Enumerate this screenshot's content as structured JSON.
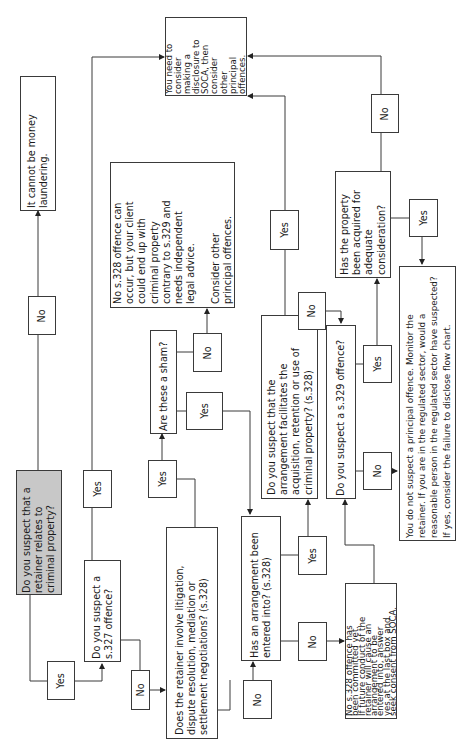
{
  "flowchart": {
    "orientation": "rotated-90-ccw",
    "nodes": {
      "start": {
        "text": "Do you suspect that a\nretainer relates to\ncriminal property?"
      },
      "not_ml": {
        "text": "It cannot be money\nlaundering."
      },
      "s327": {
        "text": "Do you suspect a\ns.327 offence?"
      },
      "disclose": {
        "text": "You need to\nconsider\nmaking a\ndisclosure to\nSOCA, then\nconsider\nother\nprincipal\noffences."
      },
      "litigation": {
        "text": "Does the retainer involve litigation,\ndispute resolution, mediation or\nsettlement negotiations? (s.328)"
      },
      "sham": {
        "text": "Are these a sham?"
      },
      "no328_occur": {
        "text": "No s.328 offence can\noccur, but your client\ncould end up with\ncriminal property\ncontrary to s.329 and\nneeds independent\nlegal advice.\n\nConsider other\nprincipal offences."
      },
      "arrangement": {
        "text": "Has an arrangement been\nentered into? (s.328)"
      },
      "no328_yet": {
        "text": "No s.328 offence has\nbeen committed yet.\nIf future conduct of the\nretainer will cause an\narrangement to be\nentered into, answer\nyes at the last box and\nseek consent from SOCA."
      },
      "facilitates": {
        "text": "Do you suspect that the\narrangement facilitates the\nacquisition, retention or use of\ncriminal property? (s.328)"
      },
      "s329": {
        "text": "Do you suspect a s.329 offence?"
      },
      "consideration": {
        "text": "Has the property\nbeen acquired for\nadequate\nconsideration?"
      },
      "no_principal": {
        "text": "You do not suspect a principal offence. Monitor the\nretainer. If you are in the regulated sector, would a\nreasonable person in the regulated sector have suspected?\nIf yes, consider the failure to disclose flow chart."
      }
    },
    "edge_labels": {
      "start_no": "No",
      "start_yes": "Yes",
      "s327_yes": "Yes",
      "s327_no": "No",
      "litigation_yes": "Yes",
      "litigation_no": "No",
      "sham_yes": "Yes",
      "sham_no": "No",
      "arrangement_yes": "Yes",
      "arrangement_no": "No",
      "facilitates_yes": "Yes",
      "facilitates_no": "No",
      "s329_yes": "Yes",
      "s329_no": "No",
      "consideration_yes": "Yes",
      "consideration_no": "No"
    },
    "colors": {
      "start_fill": "#c8c8c8",
      "box_fill": "#ffffff",
      "line": "#3a3a3a"
    }
  }
}
